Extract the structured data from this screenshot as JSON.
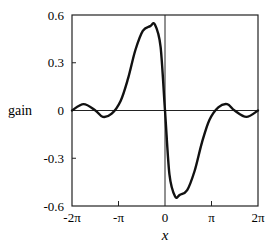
{
  "chart_data": {
    "type": "line",
    "title": "",
    "xlabel": "x",
    "ylabel": "gain",
    "xlim": [
      -6.2832,
      6.2832
    ],
    "ylim": [
      -0.6,
      0.6
    ],
    "x_ticks": [
      {
        "value": -6.2832,
        "label": "-2π"
      },
      {
        "value": -3.1416,
        "label": "-π"
      },
      {
        "value": 0,
        "label": "0"
      },
      {
        "value": 3.1416,
        "label": "π"
      },
      {
        "value": 6.2832,
        "label": "2π"
      }
    ],
    "y_ticks": [
      {
        "value": 0.6,
        "label": "0.6"
      },
      {
        "value": 0.3,
        "label": "0.3"
      },
      {
        "value": 0,
        "label": "0"
      },
      {
        "value": -0.3,
        "label": "-0.3"
      },
      {
        "value": -0.6,
        "label": "-0.6"
      }
    ],
    "grid": false,
    "reference_lines": {
      "horizontal_zero": true,
      "vertical_zero": true
    },
    "series": [
      {
        "name": "gain",
        "x": [
          -6.28,
          -5.5,
          -4.7,
          -4.2,
          -3.6,
          -3.0,
          -2.5,
          -2.0,
          -1.5,
          -1.0,
          -0.68,
          -0.3,
          0,
          0.3,
          0.68,
          1.0,
          1.5,
          2.0,
          2.5,
          3.0,
          3.6,
          4.2,
          4.7,
          5.5,
          6.28
        ],
        "values": [
          0.0,
          0.04,
          0.0,
          -0.04,
          -0.02,
          0.06,
          0.2,
          0.38,
          0.5,
          0.53,
          0.54,
          0.4,
          0.0,
          -0.4,
          -0.54,
          -0.53,
          -0.5,
          -0.38,
          -0.2,
          -0.06,
          0.02,
          0.04,
          0.0,
          -0.04,
          0.0
        ]
      }
    ]
  }
}
